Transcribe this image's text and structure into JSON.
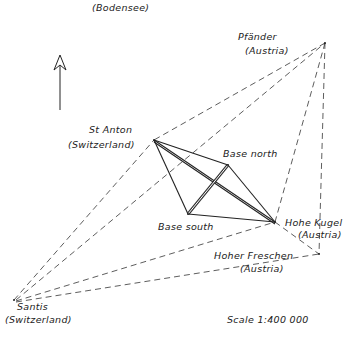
{
  "labels": {
    "bodensee": "(Bodensee)",
    "pfander_name": "Pfänder",
    "pfander_country": "(Austria)",
    "st_anton_name": "St Anton",
    "st_anton_country": "(Switzerland)",
    "base_north": "Base north",
    "base_south": "Base south",
    "hohe_kugel_name": "Hohe Kugel",
    "hohe_kugel_country": "(Austria)",
    "hoher_freschen_name": "Hoher Freschen",
    "hoher_freschen_country": "(Austria)",
    "santis_name": "Santis",
    "santis_country": "(Switzerland)",
    "scale": "Scale 1:400 000"
  },
  "points": {
    "pfander": [
      325,
      43
    ],
    "st_anton": [
      154,
      140
    ],
    "base_north": [
      228,
      165
    ],
    "base_south": [
      188,
      214
    ],
    "hohe_kugel": [
      275,
      222
    ],
    "hoher_freschen": [
      319,
      254
    ],
    "santis": [
      14,
      300
    ]
  },
  "icons": {
    "north_arrow": "north-arrow-icon"
  }
}
